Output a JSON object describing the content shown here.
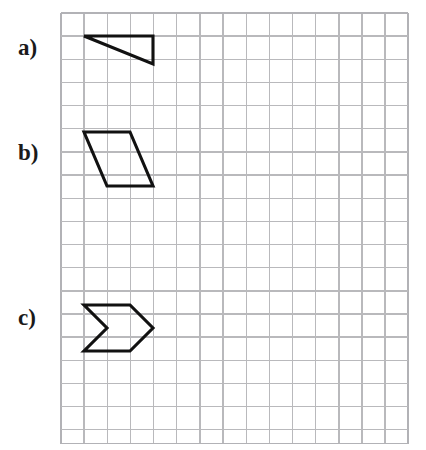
{
  "page": {
    "width": 426,
    "height": 450,
    "background_color": "#ffffff"
  },
  "grid": {
    "origin_x": 61,
    "origin_y": 13,
    "cell_size": 23.15,
    "columns": 15,
    "rows": 18.6,
    "line_color": "#b9b9bc",
    "line_width": 1.4
  },
  "style": {
    "shape_stroke_color": "#111111",
    "shape_stroke_width": 3.1,
    "label_color": "#1a1a1a"
  },
  "items": [
    {
      "id": "a",
      "label": "a)",
      "label_x": 18,
      "label_y": 55,
      "shape_name": "right-triangle",
      "points": "84,36 153,36 153,64",
      "closed": true,
      "grid_vertices": [
        [
          1,
          1
        ],
        [
          4,
          1
        ],
        [
          4,
          2.2
        ]
      ]
    },
    {
      "id": "b",
      "label": "b)",
      "label_x": 18,
      "label_y": 160,
      "shape_name": "parallelogram",
      "points": "84,132 130,132 153,186 107,186",
      "closed": true,
      "grid_vertices": [
        [
          1,
          5.14
        ],
        [
          3,
          5.14
        ],
        [
          4,
          7.47
        ],
        [
          2,
          7.47
        ]
      ]
    },
    {
      "id": "c",
      "label": "c)",
      "label_x": 18,
      "label_y": 325,
      "shape_name": "chevron-arrow",
      "points": "84,305 130,305 153,328 130,351 84,351 107,328",
      "closed": true,
      "grid_vertices": [
        [
          1,
          12.6
        ],
        [
          3,
          12.6
        ],
        [
          4,
          13.6
        ],
        [
          3,
          14.6
        ],
        [
          1,
          14.6
        ],
        [
          2,
          13.6
        ]
      ]
    }
  ]
}
